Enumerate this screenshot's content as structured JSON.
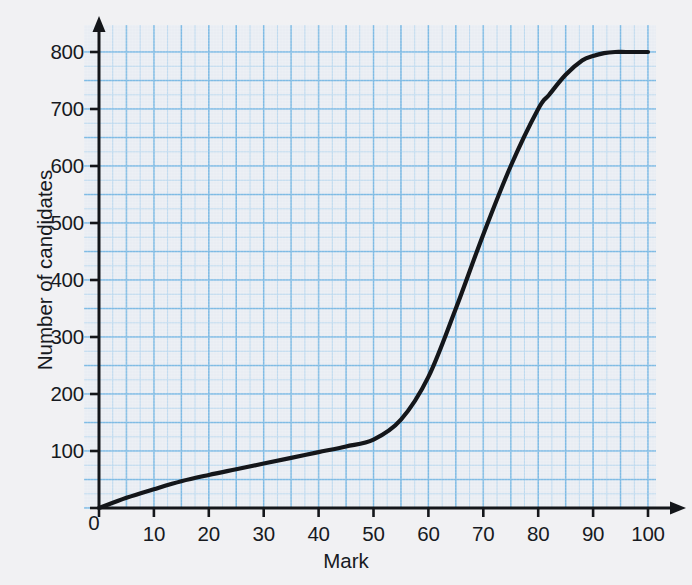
{
  "figure": {
    "kind": "cumulative-frequency-graph",
    "paper": {
      "background_color": "#f1f1f3",
      "grid_panel_color": "#e9edf3",
      "grid_major_color": "#7fbbe4",
      "grid_minor_color": "#bcd9ef",
      "axis_color": "#14161a",
      "curve_color": "#14161a"
    }
  },
  "chart_data": {
    "type": "line",
    "title": "",
    "subtitle": "",
    "xlabel": "Mark",
    "ylabel": "Number of candidates",
    "xlim": [
      0,
      100
    ],
    "ylim": [
      0,
      800
    ],
    "grid": true,
    "legend": "none",
    "x_ticks": [
      0,
      10,
      20,
      30,
      40,
      50,
      60,
      70,
      80,
      90,
      100
    ],
    "x_tick_labels": [
      "0",
      "10",
      "20",
      "30",
      "40",
      "50",
      "60",
      "70",
      "80",
      "90",
      "100"
    ],
    "y_ticks": [
      0,
      100,
      200,
      300,
      400,
      500,
      600,
      700,
      800
    ],
    "y_tick_labels": [
      "0",
      "100",
      "200",
      "300",
      "400",
      "500",
      "600",
      "700",
      "800"
    ],
    "x_minor_step": 2.5,
    "y_minor_step": 25,
    "x_major_step": 10,
    "y_major_step": 100,
    "series": [
      {
        "name": "Cumulative frequency",
        "x": [
          0,
          5,
          10,
          15,
          20,
          25,
          30,
          35,
          40,
          45,
          50,
          55,
          60,
          65,
          70,
          75,
          80,
          82,
          85,
          88,
          90,
          92,
          94,
          96,
          100
        ],
        "y": [
          0,
          18,
          33,
          47,
          58,
          68,
          78,
          88,
          98,
          108,
          120,
          155,
          230,
          350,
          480,
          600,
          700,
          725,
          760,
          785,
          793,
          798,
          800,
          800,
          800
        ]
      }
    ],
    "annotations": []
  },
  "axis_titles": {
    "x": "Mark",
    "y": "Number of candidates"
  },
  "origin": {
    "label": "0"
  }
}
